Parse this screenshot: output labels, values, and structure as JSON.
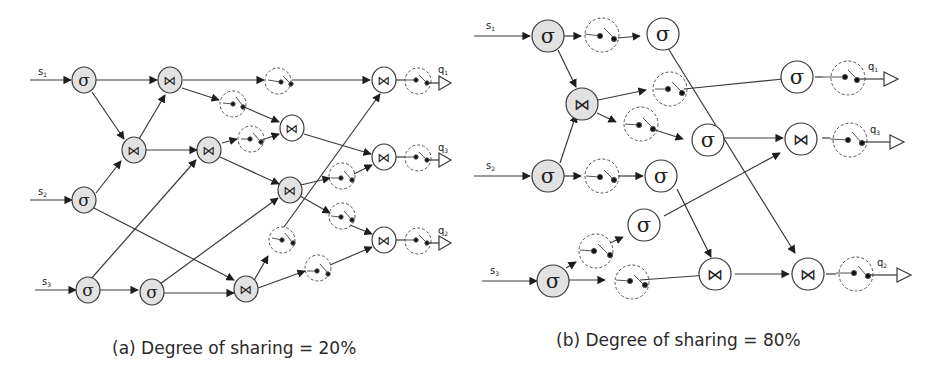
{
  "figure": {
    "panels": [
      {
        "id": "a",
        "caption": "(a) Degree of sharing = 20%",
        "caption_prefix": "(a)",
        "caption_text": "Degree of sharing = 20%",
        "degree_of_sharing": "20%",
        "inputs": [
          "s1",
          "s2",
          "s3"
        ],
        "outputs": [
          "q1",
          "q3",
          "q2"
        ],
        "node_types": {
          "select": "σ",
          "join": "⋈",
          "switch": "switch"
        }
      },
      {
        "id": "b",
        "caption": "(b) Degree of sharing = 80%",
        "caption_prefix": "(b)",
        "caption_text": "Degree of sharing = 80%",
        "degree_of_sharing": "80%",
        "inputs": [
          "s1",
          "s2",
          "s3"
        ],
        "outputs": [
          "q1",
          "q3",
          "q2"
        ],
        "node_types": {
          "select": "σ",
          "join": "⋈",
          "switch": "switch"
        }
      }
    ],
    "symbols": {
      "select": "σ",
      "join": "⋈"
    },
    "labels": {
      "s1": "s",
      "s1_sub": "1",
      "s2": "s",
      "s2_sub": "2",
      "s3": "s",
      "s3_sub": "3",
      "q1": "q",
      "q1_sub": "1",
      "q2": "q",
      "q2_sub": "2",
      "q3": "q",
      "q3_sub": "3"
    },
    "colors": {
      "shared_fill": "#e2e2e2",
      "unshared_fill": "#ffffff",
      "stroke": "#3a3a3a",
      "switch_stroke": "#555555"
    }
  }
}
